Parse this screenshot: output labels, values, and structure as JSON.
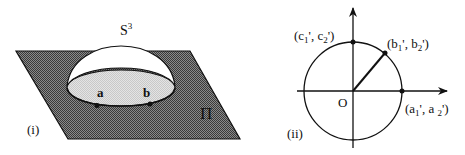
{
  "figure_i": {
    "panel_label": "(i)",
    "sphere_label": "S",
    "sphere_superscript": "3",
    "plane_label": "Π",
    "point_a_label": "a",
    "point_b_label": "b",
    "colors": {
      "plane_fill": "#6b6b6b",
      "disk_fill": "#d8d8d8",
      "dome_fill": "#ffffff",
      "stroke": "#111111"
    }
  },
  "figure_ii": {
    "panel_label": "(ii)",
    "origin_label": "O",
    "point_c_label": {
      "open": "(c",
      "sub1": "1",
      "mid": "', c",
      "sub2": "2",
      "close": "')"
    },
    "point_b_label": {
      "open": "(b",
      "sub1": "1",
      "mid": "', b",
      "sub2": "2",
      "close": "')"
    },
    "point_a_label": {
      "open": "(a",
      "sub1": "1",
      "mid": "', a ",
      "sub2": "2",
      "close": "')"
    },
    "colors": {
      "stroke": "#111111"
    }
  }
}
